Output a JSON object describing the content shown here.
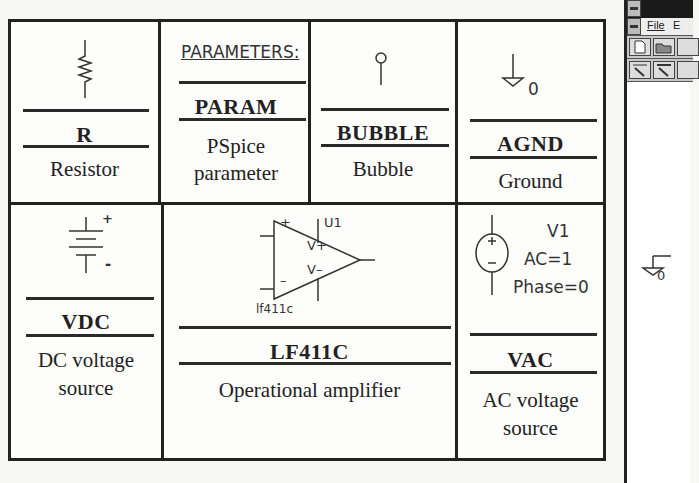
{
  "table": {
    "cells": [
      {
        "id": "resistor",
        "name": "R",
        "description_lines": [
          "Resistor"
        ]
      },
      {
        "id": "param",
        "symbol_label": "PARAMETERS:",
        "name": "PARAM",
        "description_lines": [
          "PSpice",
          "parameter"
        ]
      },
      {
        "id": "bubble",
        "name": "BUBBLE",
        "description_lines": [
          "Bubble"
        ]
      },
      {
        "id": "agnd",
        "symbol_label": "0",
        "name": "AGND",
        "description_lines": [
          "Ground"
        ]
      },
      {
        "id": "vdc",
        "plus": "+",
        "minus": "-",
        "name": "VDC",
        "description_lines": [
          "DC voltage",
          "source"
        ]
      },
      {
        "id": "lf411c",
        "ref": "U1",
        "part": "lf411c",
        "pin_plus": "+",
        "pin_minus": "–",
        "vplus": "V+",
        "vminus": "V–",
        "name": "LF411C",
        "description_lines": [
          "Operational amplifier"
        ]
      },
      {
        "id": "vac",
        "ref": "V1",
        "ac": "AC=1",
        "phase": "Phase=0",
        "name": "VAC",
        "description_lines": [
          "AC voltage",
          "source"
        ]
      }
    ]
  },
  "window": {
    "menu": [
      "File",
      "E"
    ],
    "ground_label": "0"
  }
}
